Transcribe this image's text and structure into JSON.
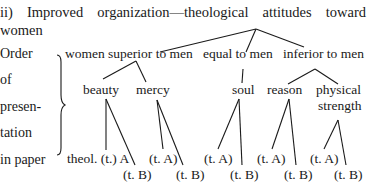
{
  "heading": {
    "words": [
      "ii)",
      "Improved",
      "organization—theological",
      "attitudes",
      "toward"
    ],
    "continuation": "women"
  },
  "left_label": {
    "lines": [
      "Order",
      "of",
      "presen-",
      "tation",
      "in paper"
    ]
  },
  "tree": {
    "level1": {
      "superior": "women superior to men",
      "equal": "equal to men",
      "inferior": "inferior to men"
    },
    "level2": {
      "beauty": "beauty",
      "mercy": "mercy",
      "soul": "soul",
      "reason": "reason",
      "physical_1": "physical",
      "physical_2": "strength"
    },
    "leaves": {
      "beauty_a": "theol. (t.) A",
      "beauty_b": "(t. B)",
      "mercy_a": "(t. A)",
      "mercy_b": "(t. B)",
      "soul_a": "(t. A)",
      "soul_b": "(t. B)",
      "reason_a": "(t. A)",
      "reason_b": "(t. B)",
      "physical_a": "(t. A)",
      "physical_b": "(t. B)"
    }
  }
}
